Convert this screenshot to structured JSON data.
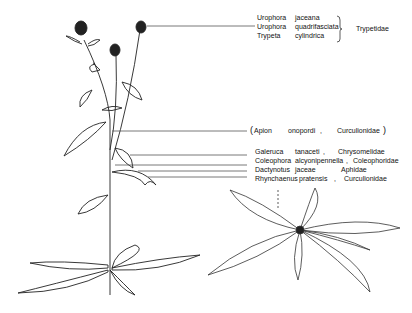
{
  "groups": {
    "flower_heads": {
      "bracket_family": "Trypetidae",
      "insects": [
        {
          "genus": "Urophora",
          "species": "jaceana"
        },
        {
          "genus": "Urophora",
          "species": "quadrifasciata"
        },
        {
          "genus": "Trypeta",
          "species": "cylindrica"
        }
      ]
    },
    "stem": {
      "open_paren": "(",
      "genus": "Apion",
      "species": "onopordi",
      "comma": ",",
      "family": "Curculionidae",
      "close_paren": ")"
    },
    "leaves": [
      {
        "genus": "Galeruca",
        "species": "tanaceti",
        "comma": ",",
        "family": "Chrysomelidae"
      },
      {
        "genus": "Coleophora",
        "species": "alcyonipennella",
        "comma": ",",
        "family": "Coleophoridae"
      },
      {
        "genus": "Dactynotus",
        "species": "jaceae",
        "comma": "",
        "family": "Aphidae"
      },
      {
        "genus": "Rhynchaenus",
        "species": "pratensis",
        "comma": ",",
        "family": "Curculionidae"
      }
    ]
  },
  "colors": {
    "ink": "#111111",
    "line": "#555555",
    "background": "#ffffff"
  }
}
